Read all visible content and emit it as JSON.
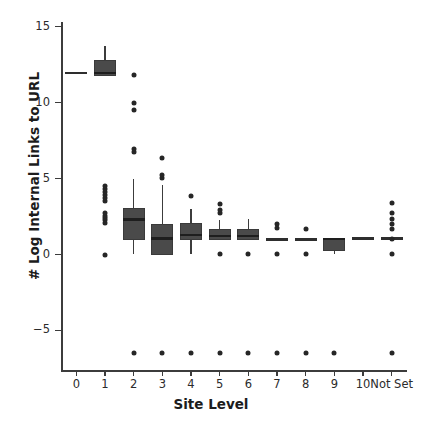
{
  "chart_data": {
    "type": "box",
    "title": "",
    "xlabel": "Site Level",
    "ylabel": "# Log Internal Links to URL",
    "categories": [
      "0",
      "1",
      "2",
      "3",
      "4",
      "5",
      "6",
      "7",
      "8",
      "9",
      "10",
      "Not Set"
    ],
    "ylim": [
      -7.6,
      15.3
    ],
    "yticks": [
      15,
      10,
      5,
      0,
      -5
    ],
    "ytick_labels": [
      "15",
      "10",
      "5",
      "0",
      "−5"
    ],
    "grid": false,
    "legend": null,
    "box_color": "#4a4a4a",
    "median_color": "#1e1e1e",
    "flier_color": "#262626",
    "boxes": [
      {
        "category": "0",
        "q1": 11.95,
        "median": 11.95,
        "q3": 11.95,
        "whisker_low": 11.95,
        "whisker_high": 11.95,
        "degenerate": true,
        "fliers": []
      },
      {
        "category": "1",
        "q1": 11.75,
        "median": 11.95,
        "q3": 12.8,
        "whisker_low": 11.75,
        "whisker_high": 13.7,
        "degenerate": false,
        "fliers": [
          0.0,
          2.1,
          2.25,
          2.4,
          2.55,
          2.7,
          3.5,
          3.7,
          3.9,
          4.1,
          4.3,
          4.5
        ]
      },
      {
        "category": "2",
        "q1": 0.95,
        "median": 2.3,
        "q3": 3.05,
        "whisker_low": 0.0,
        "whisker_high": 5.0,
        "degenerate": false,
        "fliers": [
          -6.5,
          6.75,
          6.95,
          9.5,
          9.95,
          11.8
        ]
      },
      {
        "category": "3",
        "q1": 0.0,
        "median": 1.05,
        "q3": 2.0,
        "whisker_low": 0.0,
        "whisker_high": 4.55,
        "degenerate": false,
        "fliers": [
          -6.5,
          5.05,
          5.25,
          6.35
        ]
      },
      {
        "category": "4",
        "q1": 0.95,
        "median": 1.3,
        "q3": 2.05,
        "whisker_low": 0.0,
        "whisker_high": 3.0,
        "degenerate": false,
        "fliers": [
          -6.5,
          3.85
        ]
      },
      {
        "category": "5",
        "q1": 0.95,
        "median": 1.2,
        "q3": 1.65,
        "whisker_low": 0.95,
        "whisker_high": 2.3,
        "degenerate": false,
        "fliers": [
          -6.5,
          0.05,
          2.75,
          2.95,
          3.35
        ]
      },
      {
        "category": "6",
        "q1": 0.95,
        "median": 1.2,
        "q3": 1.65,
        "whisker_low": 0.95,
        "whisker_high": 2.35,
        "degenerate": false,
        "fliers": [
          -6.5,
          0.05
        ]
      },
      {
        "category": "7",
        "q1": 1.0,
        "median": 1.0,
        "q3": 1.0,
        "whisker_low": 1.0,
        "whisker_high": 1.0,
        "degenerate": true,
        "fliers": [
          -6.5,
          0.05,
          1.75,
          2.0
        ]
      },
      {
        "category": "8",
        "q1": 1.0,
        "median": 1.0,
        "q3": 1.0,
        "whisker_low": 1.0,
        "whisker_high": 1.0,
        "degenerate": true,
        "fliers": [
          -6.5,
          0.05,
          1.7
        ]
      },
      {
        "category": "9",
        "q1": 0.2,
        "median": 1.0,
        "q3": 1.1,
        "whisker_low": 0.05,
        "whisker_high": 1.1,
        "degenerate": false,
        "fliers": [
          -6.5
        ]
      },
      {
        "category": "10",
        "q1": 1.05,
        "median": 1.05,
        "q3": 1.05,
        "whisker_low": 1.05,
        "whisker_high": 1.05,
        "degenerate": true,
        "fliers": []
      },
      {
        "category": "Not Set",
        "q1": 1.05,
        "median": 1.05,
        "q3": 1.05,
        "whisker_low": 1.05,
        "whisker_high": 1.05,
        "degenerate": true,
        "fliers": [
          -6.5,
          0.05,
          1.05,
          1.65,
          2.0,
          2.35,
          2.75,
          3.4
        ]
      }
    ]
  }
}
